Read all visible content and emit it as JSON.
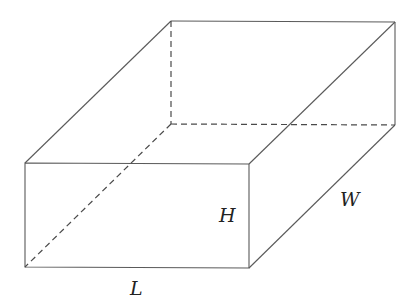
{
  "diagram": {
    "type": "rectangular-prism",
    "labels": {
      "length": "L",
      "width": "W",
      "height": "H"
    },
    "vertices": {
      "front_top_left": [
        25,
        163
      ],
      "front_top_right": [
        249,
        164
      ],
      "front_bottom_left": [
        25,
        267
      ],
      "front_bottom_right": [
        249,
        268
      ],
      "back_top_left": [
        171,
        21
      ],
      "back_top_right": [
        395,
        22
      ],
      "back_bottom_right": [
        395,
        125
      ],
      "back_bottom_left": [
        171,
        124
      ]
    },
    "colors": {
      "edge": "#5a5a5a",
      "label": "#222222",
      "background": "#ffffff"
    }
  }
}
